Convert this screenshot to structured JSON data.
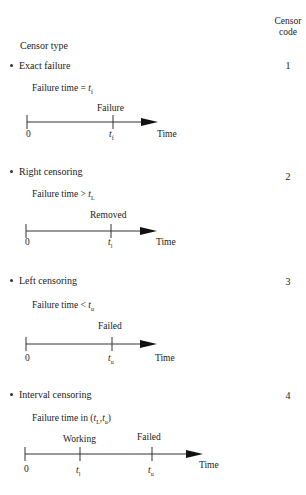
{
  "header": {
    "code_label_line1": "Censor",
    "code_label_line2": "code",
    "type_label": "Censor type"
  },
  "sections": [
    {
      "title": "Exact failure",
      "code": "1",
      "formula_prefix": "Failure time = ",
      "formula_var": "t",
      "formula_sub": "f",
      "event_label": "Failure",
      "origin_label": "0",
      "tick_var": "t",
      "tick_sub": "f",
      "axis_label": "Time"
    },
    {
      "title": "Right censoring",
      "code": "2",
      "formula_prefix": "Failure time > ",
      "formula_var": "t",
      "formula_sub": "L",
      "event_label": "Removed",
      "origin_label": "0",
      "tick_var": "t",
      "tick_sub": "l",
      "axis_label": "Time"
    },
    {
      "title": "Left censoring",
      "code": "3",
      "formula_prefix": "Failure time < ",
      "formula_var": "t",
      "formula_sub": "u",
      "event_label": "Failed",
      "origin_label": "0",
      "tick_var": "t",
      "tick_sub": "u",
      "axis_label": "Time"
    },
    {
      "title": "Interval censoring",
      "code": "4",
      "formula_prefix": "Failure time in (",
      "formula_var": "t",
      "formula_sub": "L",
      "formula_mid": ",",
      "formula_var2": "t",
      "formula_sub2": "u",
      "formula_suffix": ")",
      "event_label": "Working",
      "event_label2": "Failed",
      "origin_label": "0",
      "tick_var": "t",
      "tick_sub": "l",
      "tick_var2": "t",
      "tick_sub2": "u",
      "axis_label": "Time"
    }
  ]
}
